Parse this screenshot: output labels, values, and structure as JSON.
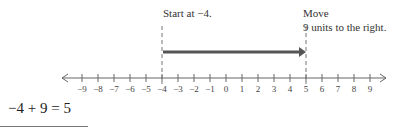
{
  "annotations": {
    "start": "Start at −4.",
    "move_line1": "Move",
    "move_line2": "9 units to the right."
  },
  "number_line": {
    "min": -9,
    "max": 9,
    "tick_labels": [
      "−9",
      "−8",
      "−7",
      "−6",
      "−5",
      "−4",
      "−3",
      "−2",
      "−1",
      "0",
      "1",
      "2",
      "3",
      "4",
      "5",
      "6",
      "7",
      "8",
      "9"
    ],
    "start_value": -4,
    "end_value": 5,
    "arrow_color": "#555555",
    "axis_color": "#666666"
  },
  "equation": "−4 + 9 = 5"
}
